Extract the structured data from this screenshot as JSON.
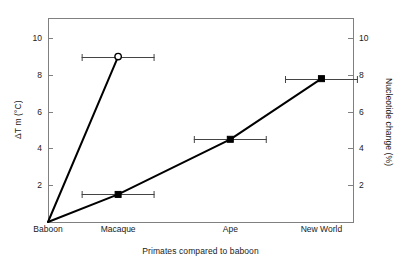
{
  "chart_data": {
    "type": "line",
    "title": "",
    "xlabel": "Primates compared to baboon",
    "ylabel": "ΔT m (°C)",
    "ylabel_right": "Nucleotide change (%)",
    "categories": [
      "Baboon",
      "Macaque",
      "Ape",
      "New World"
    ],
    "category_positions": [
      0,
      1,
      2.6,
      3.9
    ],
    "xlim": [
      0,
      4.35
    ],
    "ylim": [
      0,
      11.1
    ],
    "ylim_right": [
      0,
      11.1
    ],
    "yticks": [
      2,
      4,
      6,
      8,
      10
    ],
    "ytick_labels": [
      "2",
      "4",
      "6",
      "8",
      "10"
    ],
    "yticks_right": [
      2,
      4,
      6,
      8,
      10
    ],
    "ytick_labels_right": [
      "2",
      "4",
      "6",
      "8",
      "10"
    ],
    "grid": false,
    "legend": "none",
    "series": [
      {
        "name": "single-copy DNA (steep)",
        "marker": "open-circle",
        "color": "#000000",
        "points": [
          {
            "category": "Baboon",
            "x": 0,
            "y": 0,
            "xerr": 0,
            "marker": "none"
          },
          {
            "category": "Macaque",
            "x": 1,
            "y": 9.0,
            "xerr": 0.52,
            "marker": "open-circle"
          }
        ]
      },
      {
        "name": "nucleotide change (shallow)",
        "marker": "filled-square",
        "color": "#000000",
        "points": [
          {
            "category": "Baboon",
            "x": 0,
            "y": 0,
            "xerr": 0,
            "marker": "none"
          },
          {
            "category": "Macaque",
            "x": 1,
            "y": 1.5,
            "xerr": 0.52,
            "marker": "filled-square"
          },
          {
            "category": "Ape",
            "x": 2.6,
            "y": 4.5,
            "xerr": 0.52,
            "marker": "filled-square"
          },
          {
            "category": "New World",
            "x": 3.9,
            "y": 7.8,
            "xerr": 0.52,
            "marker": "filled-square"
          }
        ]
      }
    ],
    "colors": {
      "line": "#000000",
      "frame": "#808080",
      "text": "#1a1a1a",
      "errorbar": "#444444",
      "background": "#ffffff"
    }
  }
}
